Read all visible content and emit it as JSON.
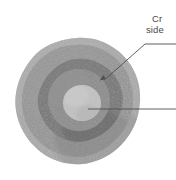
{
  "figure": {
    "name": "cross-section-sphere-diagram",
    "background_color": "#ffffff",
    "specimen": {
      "name": "sectioned-spherical-specimen",
      "outline": "irregular rough-edged circle",
      "center_x": 77,
      "center_y": 101,
      "zones": [
        {
          "name": "outer-rim",
          "label": "outer rim",
          "color": "#a8a8a8",
          "radius": 63,
          "texture": "coarse speckled"
        },
        {
          "name": "outer-band",
          "label": "outer band",
          "color": "#989898",
          "radius": 56,
          "texture": "speckled"
        },
        {
          "name": "middle-ring",
          "label": "middle dark ring",
          "color": "#767676",
          "radius": 42,
          "texture": "mottled dark"
        },
        {
          "name": "inner-ring",
          "label": "inner ring",
          "color": "#8d8d8d",
          "radius": 30,
          "texture": "mottled"
        },
        {
          "name": "core",
          "label": "light core",
          "color": "#c2c2c2",
          "radius": 18,
          "texture": "fine pale"
        }
      ]
    },
    "callouts": [
      {
        "name": "callout-crack",
        "line1": "Cr",
        "line2": "side",
        "clipped_at_right_edge": true,
        "leader": {
          "type": "elbow-with-arrow",
          "text_anchor_x": 176,
          "text_anchor_y": 44,
          "elbow_x": 145,
          "elbow_y": 44,
          "arrow_tip_x": 104,
          "arrow_tip_y": 80,
          "points_to_zone": "middle-ring"
        }
      },
      {
        "name": "callout-core",
        "line1": "",
        "clipped_at_right_edge": true,
        "leader": {
          "type": "straight-horizontal",
          "start_x": 88,
          "start_y": 109,
          "end_x": 176,
          "end_y": 109,
          "points_to_zone": "core"
        }
      }
    ],
    "line_color": "#4f4f4f"
  }
}
